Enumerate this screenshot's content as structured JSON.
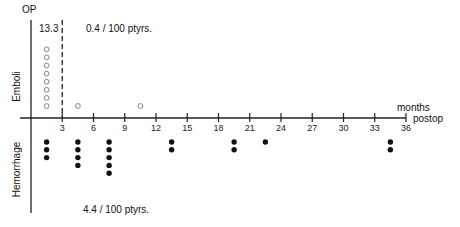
{
  "chart_data": {
    "type": "scatter",
    "title": "",
    "xlabel": "months postop",
    "xlabel_lines": [
      "months",
      "postop"
    ],
    "ylabel_top": "OP",
    "x_ticks": [
      3,
      6,
      9,
      12,
      15,
      18,
      21,
      24,
      27,
      30,
      33,
      36
    ],
    "xlim": [
      0,
      36
    ],
    "grid": false,
    "dashed_line_at_month": 3,
    "upper_panel": {
      "name": "Emboli",
      "marker": "open-circle",
      "early_rate_label": "13.3",
      "late_rate_label": "0.4 / 100  ptyrs.",
      "events": [
        {
          "month": 1.5,
          "count": 8
        },
        {
          "month": 4.5,
          "count": 1
        },
        {
          "month": 10.5,
          "count": 1
        }
      ]
    },
    "lower_panel": {
      "name": "Hemorrhage",
      "marker": "filled-circle",
      "rate_label": "4.4 / 100  ptyrs.",
      "events": [
        {
          "month": 1.5,
          "count": 3
        },
        {
          "month": 4.5,
          "count": 4
        },
        {
          "month": 7.5,
          "count": 5
        },
        {
          "month": 13.5,
          "count": 2
        },
        {
          "month": 19.5,
          "count": 2
        },
        {
          "month": 22.5,
          "count": 1
        },
        {
          "month": 34.5,
          "count": 2
        }
      ]
    }
  },
  "labels": {
    "op": "OP",
    "emboli": "Emboli",
    "hemorrhage": "Hemorrhage",
    "early_rate": "13.3",
    "emboli_rate": "0.4 / 100  ptyrs.",
    "hemorrhage_rate": "4.4 / 100  ptyrs.",
    "months": "months",
    "postop": "postop"
  }
}
